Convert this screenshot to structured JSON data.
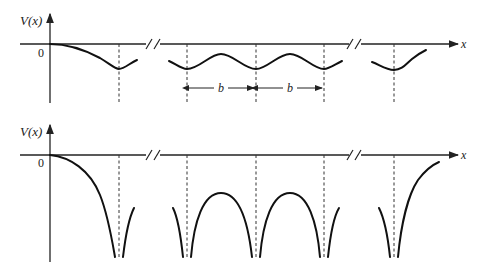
{
  "figure": {
    "top_panel": {
      "ylabel": "V(x)",
      "origin_label": "0",
      "xlabel": "x",
      "period_label_1": "b",
      "period_label_2": "b",
      "description": "Weak periodic potential: smooth sinusoidal wells"
    },
    "bottom_panel": {
      "ylabel": "V(x)",
      "origin_label": "0",
      "xlabel": "x",
      "description": "Strong periodic potential: deep cusp-like Coulomb wells"
    }
  }
}
